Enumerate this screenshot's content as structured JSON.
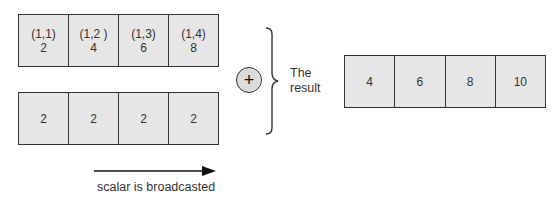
{
  "top_array": {
    "cells": [
      {
        "index": "(1,1)",
        "value": "2"
      },
      {
        "index": "(1,2 )",
        "value": "4"
      },
      {
        "index": "(1,3)",
        "value": "6"
      },
      {
        "index": "(1,4)",
        "value": "8"
      }
    ]
  },
  "bottom_array": {
    "cells": [
      {
        "value": "2"
      },
      {
        "value": "2"
      },
      {
        "value": "2"
      },
      {
        "value": "2"
      }
    ]
  },
  "operator": {
    "symbol": "+",
    "icon": "plus-circle-icon"
  },
  "result_label": {
    "line1": "The",
    "line2": "result"
  },
  "result_array": {
    "cells": [
      {
        "value": "4"
      },
      {
        "value": "6"
      },
      {
        "value": "8"
      },
      {
        "value": "10"
      }
    ]
  },
  "arrow": {
    "label": "scalar is broadcasted",
    "icon": "right-arrow-icon"
  },
  "colors": {
    "cell_fill": "#e6e6e6",
    "border": "#333333",
    "operator_fill": "#dcdcdc"
  }
}
